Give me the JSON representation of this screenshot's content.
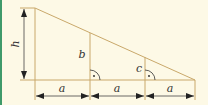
{
  "diagram": {
    "type": "geometry-triangle-with-dimensions",
    "colors": {
      "background": "#fdf9e6",
      "border": "#3f9a6a",
      "shape_line": "#c9a86a",
      "dimension_line": "#222222",
      "text": "#333333"
    },
    "labels": {
      "height": "h",
      "segment_b": "b",
      "segment_c": "c",
      "base_1": "a",
      "base_2": "a",
      "base_3": "a"
    },
    "right_angle_marker": "·"
  }
}
